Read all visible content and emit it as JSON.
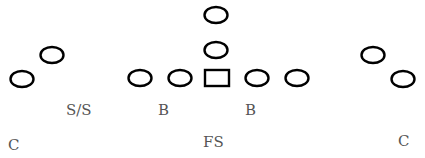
{
  "diagram": {
    "title": "",
    "stroke_color": "#000000",
    "label_color": "#555555",
    "players": [
      {
        "id": "left-corner-player",
        "shape": "ellipse",
        "cx": 22,
        "cy": 79
      },
      {
        "id": "left-wide-player",
        "shape": "ellipse",
        "cx": 52,
        "cy": 55
      },
      {
        "id": "left-tackle-player",
        "shape": "ellipse",
        "cx": 140,
        "cy": 78
      },
      {
        "id": "left-guard-player",
        "shape": "ellipse",
        "cx": 180,
        "cy": 78
      },
      {
        "id": "center-square",
        "shape": "rect",
        "cx": 217,
        "cy": 78
      },
      {
        "id": "right-guard-player",
        "shape": "ellipse",
        "cx": 257,
        "cy": 78
      },
      {
        "id": "right-tackle-player",
        "shape": "ellipse",
        "cx": 297,
        "cy": 78
      },
      {
        "id": "qb-player",
        "shape": "ellipse",
        "cx": 216,
        "cy": 50
      },
      {
        "id": "back-player",
        "shape": "ellipse",
        "cx": 216,
        "cy": 15
      },
      {
        "id": "right-wide-player",
        "shape": "ellipse",
        "cx": 373,
        "cy": 55
      },
      {
        "id": "right-corner-player",
        "shape": "ellipse",
        "cx": 403,
        "cy": 79
      }
    ],
    "labels": [
      {
        "id": "label-strong-safety",
        "text": "S/S",
        "x": 66,
        "y": 115
      },
      {
        "id": "label-left-backer",
        "text": "B",
        "x": 158,
        "y": 115
      },
      {
        "id": "label-right-backer",
        "text": "B",
        "x": 245,
        "y": 115
      },
      {
        "id": "label-left-corner",
        "text": "C",
        "x": 8,
        "y": 150
      },
      {
        "id": "label-free-safety",
        "text": "FS",
        "x": 203,
        "y": 147
      },
      {
        "id": "label-right-corner",
        "text": "C",
        "x": 398,
        "y": 146
      }
    ]
  }
}
